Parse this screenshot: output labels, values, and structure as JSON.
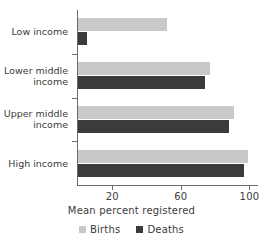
{
  "chart_data": {
    "type": "bar",
    "orientation": "horizontal",
    "title": "",
    "xlabel": "Mean percent registered",
    "ylabel": "",
    "categories": [
      "Low income",
      "Lower middle\nincome",
      "Upper middle\nincome",
      "High income"
    ],
    "series": [
      {
        "name": "Births",
        "color": "#c9c9c9",
        "values": [
          52,
          77,
          91,
          99
        ]
      },
      {
        "name": "Deaths",
        "color": "#3b3b3b",
        "values": [
          5,
          74,
          88,
          97
        ]
      }
    ],
    "xlim": [
      0,
      105
    ],
    "xticks": [
      20,
      60,
      100
    ],
    "xtick_labels": [
      "20",
      "60",
      "100"
    ],
    "grid": false,
    "legend_position": "bottom"
  },
  "axis": {
    "x_title": "Mean percent registered",
    "ticks": [
      {
        "label": "20",
        "value": 20
      },
      {
        "label": "60",
        "value": 60
      },
      {
        "label": "100",
        "value": 100
      }
    ]
  },
  "categories": [
    {
      "label": "Low income"
    },
    {
      "label": "Lower middle\nincome"
    },
    {
      "label": "Upper middle\nincome"
    },
    {
      "label": "High income"
    }
  ],
  "legend": {
    "items": [
      {
        "label": "Births",
        "color": "#c9c9c9"
      },
      {
        "label": "Deaths",
        "color": "#3b3b3b"
      }
    ]
  }
}
